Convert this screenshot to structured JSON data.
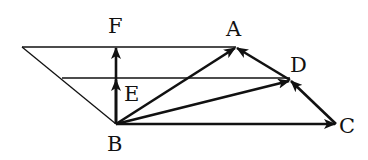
{
  "diagram": {
    "type": "vector-geometry",
    "colors": {
      "stroke": "#111111",
      "background": "#ffffff"
    },
    "points": {
      "A": {
        "label": "A",
        "x": 236,
        "y": 47
      },
      "B": {
        "label": "B",
        "x": 116,
        "y": 124
      },
      "C": {
        "label": "C",
        "x": 336,
        "y": 124
      },
      "D": {
        "label": "D",
        "x": 290,
        "y": 80
      },
      "E": {
        "label": "E",
        "x": 116,
        "y": 78
      },
      "F": {
        "label": "F",
        "x": 116,
        "y": 47
      }
    },
    "labels": {
      "A": "A",
      "B": "B",
      "C": "C",
      "D": "D",
      "E": "E",
      "F": "F"
    },
    "vectors": [
      {
        "from": "B",
        "to": "F"
      },
      {
        "from": "B",
        "to": "E"
      },
      {
        "from": "B",
        "to": "A"
      },
      {
        "from": "B",
        "to": "D"
      },
      {
        "from": "B",
        "to": "C"
      },
      {
        "from": "C",
        "to": "D"
      },
      {
        "from": "D",
        "to": "A"
      }
    ],
    "lines": [
      {
        "name": "top-horizontal",
        "from": [
          22,
          47
        ],
        "to": "A"
      },
      {
        "name": "middle-horizontal",
        "from": [
          62,
          78
        ],
        "to": "D"
      },
      {
        "name": "left-slant",
        "from": [
          22,
          47
        ],
        "to": "B"
      }
    ]
  }
}
